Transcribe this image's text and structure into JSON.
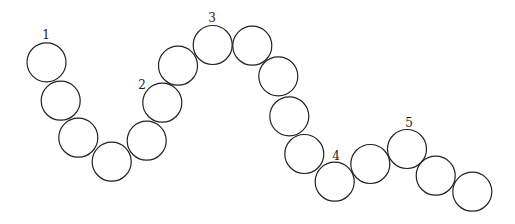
{
  "diagram": {
    "type": "chain-of-circles",
    "radius": 19.5,
    "stroke_color": "#222222",
    "circles": [
      {
        "cx": 46.5,
        "cy": 62.3
      },
      {
        "cx": 60.7,
        "cy": 100.7
      },
      {
        "cx": 78.3,
        "cy": 137.7
      },
      {
        "cx": 111.7,
        "cy": 161.7
      },
      {
        "cx": 146.7,
        "cy": 140.7
      },
      {
        "cx": 162.3,
        "cy": 102.7
      },
      {
        "cx": 178.0,
        "cy": 65.7
      },
      {
        "cx": 212.7,
        "cy": 45.0
      },
      {
        "cx": 252.3,
        "cy": 45.7
      },
      {
        "cx": 278.3,
        "cy": 76.3
      },
      {
        "cx": 289.3,
        "cy": 116.3
      },
      {
        "cx": 304.3,
        "cy": 154.0
      },
      {
        "cx": 334.7,
        "cy": 181.7
      },
      {
        "cx": 370.3,
        "cy": 164.0
      },
      {
        "cx": 407.0,
        "cy": 149.0
      },
      {
        "cx": 435.7,
        "cy": 175.7
      },
      {
        "cx": 472.3,
        "cy": 191.7
      }
    ],
    "labels": [
      {
        "text": "1",
        "x": 46,
        "y": 35
      },
      {
        "text": "2",
        "x": 142,
        "y": 85
      },
      {
        "text": "3",
        "x": 212,
        "y": 18
      },
      {
        "text": "4",
        "x": 336,
        "y": 156
      },
      {
        "text": "5",
        "x": 409,
        "y": 123
      }
    ]
  }
}
